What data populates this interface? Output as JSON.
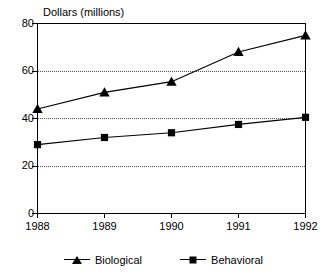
{
  "chart_data": {
    "type": "line",
    "title": "Dollars (millions)",
    "xlabel": "",
    "ylabel": "",
    "categories": [
      "1988",
      "1989",
      "1990",
      "1991",
      "1992"
    ],
    "x": [
      1988,
      1989,
      1990,
      1991,
      1992
    ],
    "series": [
      {
        "name": "Biological",
        "marker": "triangle",
        "values": [
          44,
          51,
          55.5,
          68,
          75
        ]
      },
      {
        "name": "Behavioral",
        "marker": "square",
        "values": [
          29,
          32,
          34,
          37.5,
          40.5
        ]
      }
    ],
    "ylim": [
      0,
      80
    ],
    "yticks": [
      0,
      20,
      40,
      60,
      80
    ],
    "ytick_labels": [
      "0",
      "20",
      "40",
      "60",
      "80"
    ],
    "xtick_labels": [
      "1988",
      "1989",
      "1990",
      "1991",
      "1992"
    ],
    "grid": true,
    "gridlines_at": [
      20,
      40,
      60
    ],
    "grid_style": "dotted",
    "legend_position": "bottom-center",
    "frame": true,
    "colors": {
      "line": "#000000",
      "marker": "#000000",
      "grid": "#555555",
      "axis": "#000000",
      "background": "#ffffff"
    }
  },
  "legend": {
    "items": [
      {
        "label": "Biological",
        "marker": "triangle-marker-icon"
      },
      {
        "label": "Behavioral",
        "marker": "square-marker-icon"
      }
    ]
  }
}
